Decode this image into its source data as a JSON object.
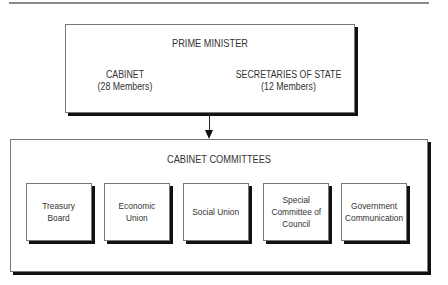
{
  "diagram": {
    "top_box": {
      "title": "PRIME MINISTER",
      "left_group": {
        "label": "CABINET",
        "detail": "(28 Members)"
      },
      "right_group": {
        "label": "SECRETARIES OF STATE",
        "detail": "(12 Members)"
      }
    },
    "bottom_box": {
      "title": "CABINET COMMITTEES",
      "committees": [
        {
          "label": "Treasury\nBoard"
        },
        {
          "label": "Economic\nUnion"
        },
        {
          "label": "Social Union"
        },
        {
          "label": "Special\nCommittee of\nCouncil"
        },
        {
          "label": "Government\nCommunication"
        }
      ]
    },
    "connector": {
      "from": "PRIME MINISTER",
      "to": "CABINET COMMITTEES",
      "type": "arrow-down"
    }
  }
}
